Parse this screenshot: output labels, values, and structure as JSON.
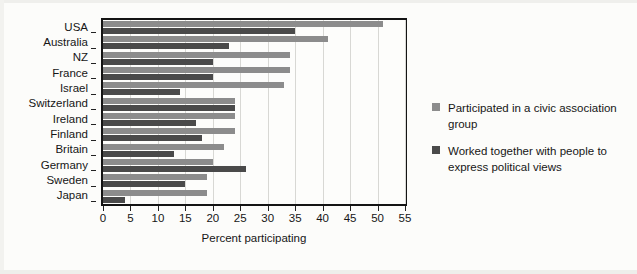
{
  "chart_data": {
    "type": "bar",
    "orientation": "horizontal",
    "title": "",
    "xlabel": "Percent participating",
    "ylabel": "",
    "xlim": [
      0,
      55
    ],
    "xticks": [
      0,
      5,
      10,
      15,
      20,
      25,
      30,
      35,
      40,
      45,
      50,
      55
    ],
    "grid": "vertical",
    "legend_position": "right",
    "categories": [
      "USA",
      "Australia",
      "NZ",
      "France",
      "Israel",
      "Switzerland",
      "Ireland",
      "Finland",
      "Britain",
      "Germany",
      "Sweden",
      "Japan"
    ],
    "series": [
      {
        "name": "Participated in a civic association group",
        "color": "#8c8c8c",
        "values": [
          51,
          41,
          34,
          34,
          33,
          24,
          24,
          24,
          22,
          20,
          19,
          19
        ]
      },
      {
        "name": "Worked together with people to express political views",
        "color": "#4a4a4a",
        "values": [
          35,
          23,
          20,
          20,
          14,
          24,
          17,
          18,
          13,
          26,
          15,
          4
        ]
      }
    ]
  },
  "legend": {
    "entries": [
      {
        "label": "Participated in a civic association group",
        "color": "#8c8c8c"
      },
      {
        "label": "Worked together with people to express political views",
        "color": "#4a4a4a"
      }
    ]
  },
  "axis": {
    "x_title": "Percent participating",
    "tick_labels": [
      "0",
      "5",
      "10",
      "15",
      "20",
      "25",
      "30",
      "35",
      "40",
      "45",
      "50",
      "55"
    ]
  }
}
